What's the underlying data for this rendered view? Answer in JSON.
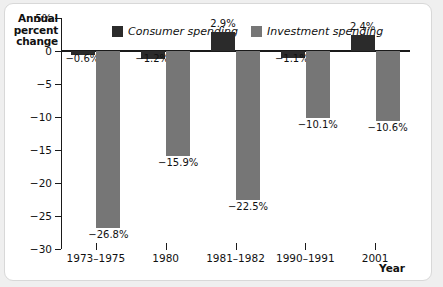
{
  "chart_data": {
    "type": "bar",
    "title": "",
    "ylabel": "Annual percent change",
    "xlabel": "Year",
    "categories": [
      "1973–1975",
      "1980",
      "1981–1982",
      "1990–1991",
      "2001"
    ],
    "series": [
      {
        "name": "Consumer spending",
        "color": "#2b2b2b",
        "values": [
          -0.6,
          -1.2,
          2.9,
          -1.1,
          2.4
        ],
        "labels": [
          "−0.6%",
          "−1.2%",
          "2.9%",
          "−1.1%",
          "2.4%"
        ]
      },
      {
        "name": "Investment spending",
        "color": "#767676",
        "values": [
          -26.8,
          -15.9,
          -22.5,
          -10.1,
          -10.6
        ],
        "labels": [
          "−26.8%",
          "−15.9%",
          "−22.5%",
          "−10.1%",
          "−10.6%"
        ]
      }
    ],
    "ylim": [
      -30,
      5
    ],
    "yticks": [
      5,
      0,
      -5,
      -10,
      -15,
      -20,
      -25,
      -30
    ],
    "ytick_labels": [
      "5%",
      "0",
      "−5",
      "−10",
      "−15",
      "−20",
      "−25",
      "−30"
    ],
    "grid": false,
    "legend_position": "top-center",
    "axis_color": "#1a1a1a",
    "background": "#ffffff"
  }
}
